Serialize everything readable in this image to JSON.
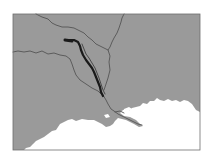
{
  "map": {
    "type": "grayscale regional river map",
    "colors": {
      "background": "#ffffff",
      "land": "#9a9a9a",
      "water": "#ffffff",
      "frame": "#6e6e6e",
      "rivers": "#555555",
      "highlighted_river": "#1a1a1a"
    },
    "frame": {
      "x": 13,
      "y": 14,
      "width": 187,
      "height": 136
    },
    "features": [
      {
        "name": "highlighted-river",
        "description": "thick dark highlighted river channel running north-west to south-east"
      },
      {
        "name": "river-north",
        "description": "thin river from top-left edge to eastern branch"
      },
      {
        "name": "river-east",
        "description": "thin river from top edge down to confluence"
      },
      {
        "name": "river-west",
        "description": "thin river from left edge flowing east then south"
      },
      {
        "name": "main-stem",
        "description": "river continuing south-east to the delta"
      },
      {
        "name": "coastline",
        "description": "irregular coast with delta and bays at bottom"
      }
    ],
    "labels": []
  }
}
